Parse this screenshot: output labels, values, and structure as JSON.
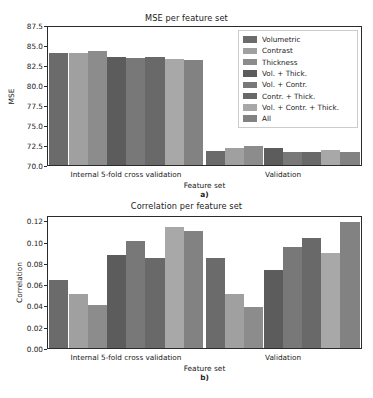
{
  "figure": {
    "background": "#ffffff",
    "text_color": "#1a1a1a"
  },
  "series_colors": [
    "#6b6b6b",
    "#a0a0a0",
    "#8c8c8c",
    "#5c5c5c",
    "#787878",
    "#696969",
    "#a8a8a8",
    "#828282"
  ],
  "legend": {
    "items": [
      {
        "label": "Volumetric",
        "color": "#6b6b6b"
      },
      {
        "label": "Contrast",
        "color": "#a0a0a0"
      },
      {
        "label": "Thickness",
        "color": "#8c8c8c"
      },
      {
        "label": "Vol. + Thick.",
        "color": "#5c5c5c"
      },
      {
        "label": "Vol. + Contr.",
        "color": "#787878"
      },
      {
        "label": "Contr. + Thick.",
        "color": "#696969"
      },
      {
        "label": "Vol. + Contr. + Thick.",
        "color": "#a8a8a8"
      },
      {
        "label": "All",
        "color": "#828282"
      }
    ]
  },
  "chart_data": [
    {
      "type": "bar",
      "panel": "a",
      "panel_label": "a)",
      "title": "MSE per feature set",
      "xlabel": "Feature set",
      "ylabel": "MSE",
      "categories": [
        "Internal 5-fold cross validation",
        "Validation"
      ],
      "ylim": [
        70.0,
        87.5
      ],
      "yticks": [
        70.0,
        72.5,
        75.0,
        77.5,
        80.0,
        82.5,
        85.0,
        87.5
      ],
      "ytick_labels": [
        "70.0",
        "72.5",
        "75.0",
        "77.5",
        "80.0",
        "82.5",
        "85.0",
        "87.5"
      ],
      "grid": false,
      "legend_position": "upper right",
      "series": [
        {
          "name": "Volumetric",
          "values": [
            84.2,
            71.8
          ]
        },
        {
          "name": "Contrast",
          "values": [
            84.2,
            72.2
          ]
        },
        {
          "name": "Thickness",
          "values": [
            84.4,
            72.4
          ]
        },
        {
          "name": "Vol. + Thick.",
          "values": [
            83.7,
            72.1
          ]
        },
        {
          "name": "Vol. + Contr.",
          "values": [
            83.6,
            71.6
          ]
        },
        {
          "name": "Contr. + Thick.",
          "values": [
            83.7,
            71.6
          ]
        },
        {
          "name": "Vol. + Contr. + Thick.",
          "values": [
            83.4,
            71.9
          ]
        },
        {
          "name": "All",
          "values": [
            83.3,
            71.7
          ]
        }
      ]
    },
    {
      "type": "bar",
      "panel": "b",
      "panel_label": "b)",
      "title": "Correlation per feature set",
      "xlabel": "Feature set",
      "ylabel": "Correlation",
      "categories": [
        "Internal 5-fold cross validation",
        "Validation"
      ],
      "ylim": [
        0.0,
        0.125
      ],
      "yticks": [
        0.0,
        0.02,
        0.04,
        0.06,
        0.08,
        0.1,
        0.12
      ],
      "ytick_labels": [
        "0.00",
        "0.02",
        "0.04",
        "0.06",
        "0.08",
        "0.10",
        "0.12"
      ],
      "grid": false,
      "legend_position": "none",
      "series": [
        {
          "name": "Volumetric",
          "values": [
            0.065,
            0.086
          ]
        },
        {
          "name": "Contrast",
          "values": [
            0.052,
            0.052
          ]
        },
        {
          "name": "Thickness",
          "values": [
            0.041,
            0.039
          ]
        },
        {
          "name": "Vol. + Thick.",
          "values": [
            0.089,
            0.074
          ]
        },
        {
          "name": "Vol. + Contr.",
          "values": [
            0.102,
            0.096
          ]
        },
        {
          "name": "Contr. + Thick.",
          "values": [
            0.086,
            0.105
          ]
        },
        {
          "name": "Vol. + Contr. + Thick.",
          "values": [
            0.115,
            0.091
          ]
        },
        {
          "name": "All",
          "values": [
            0.112,
            0.12
          ]
        }
      ]
    }
  ]
}
